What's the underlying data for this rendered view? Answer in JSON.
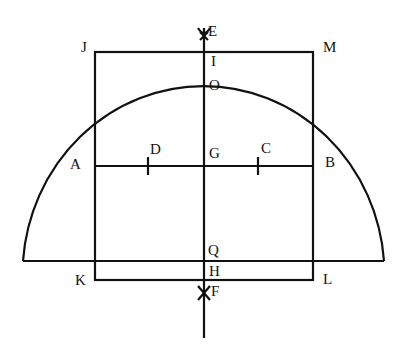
{
  "diagram": {
    "stroke_color": "#111111",
    "labels": [
      {
        "id": "E",
        "text": "E",
        "x": 208,
        "y": 24
      },
      {
        "id": "J",
        "text": "J",
        "x": 81,
        "y": 40
      },
      {
        "id": "M",
        "text": "M",
        "x": 323,
        "y": 40
      },
      {
        "id": "I",
        "text": "I",
        "x": 211,
        "y": 54
      },
      {
        "id": "O",
        "text": "O",
        "x": 209,
        "y": 78
      },
      {
        "id": "A",
        "text": "A",
        "x": 70,
        "y": 157
      },
      {
        "id": "D",
        "text": "D",
        "x": 150,
        "y": 142
      },
      {
        "id": "G",
        "text": "G",
        "x": 209,
        "y": 146
      },
      {
        "id": "C",
        "text": "C",
        "x": 261,
        "y": 141
      },
      {
        "id": "B",
        "text": "B",
        "x": 325,
        "y": 155
      },
      {
        "id": "Q",
        "text": "Q",
        "x": 208,
        "y": 243
      },
      {
        "id": "H",
        "text": "H",
        "x": 209,
        "y": 264
      },
      {
        "id": "K",
        "text": "K",
        "x": 75,
        "y": 273
      },
      {
        "id": "L",
        "text": "L",
        "x": 323,
        "y": 272
      },
      {
        "id": "F",
        "text": "F",
        "x": 211,
        "y": 284
      }
    ]
  }
}
